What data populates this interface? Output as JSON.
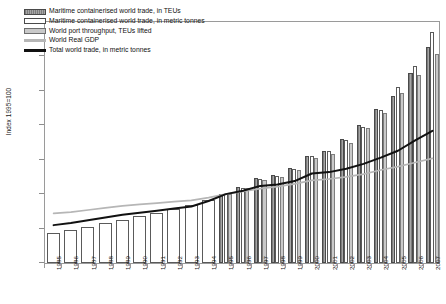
{
  "chart_data": {
    "type": "bar",
    "title": "",
    "subtitle": "",
    "xlabel": "",
    "ylabel": "Index 1995=100",
    "ylim": [
      0,
      350
    ],
    "ytick_values": [
      0,
      50,
      100,
      150,
      200,
      250,
      300,
      350
    ],
    "ytick_labels": [
      "0.0",
      "50.0",
      "100.0",
      "150.0",
      "200.0",
      "250.0",
      "300.0",
      "350.0"
    ],
    "grid": false,
    "legend_position": "upper-left",
    "categories": [
      "1985",
      "1986",
      "1987",
      "1988",
      "1989",
      "1990",
      "1991",
      "1992",
      "1993",
      "1994",
      "1995",
      "1996",
      "1997",
      "1998",
      "1999",
      "2000",
      "2001",
      "2002",
      "2003",
      "2004",
      "2005",
      "2006",
      "2007"
    ],
    "series": [
      {
        "name": "Maritime containerised world trade, in TEUs",
        "kind": "bar",
        "color": "#8f8f8f",
        "values": [
          null,
          null,
          null,
          null,
          null,
          null,
          null,
          null,
          null,
          null,
          100,
          110,
          123,
          128,
          138,
          155,
          163,
          180,
          200,
          223,
          243,
          276,
          313
        ]
      },
      {
        "name": "Maritime containerised world trade, in metric tonnes",
        "kind": "bar",
        "color": "#ffffff",
        "values": [
          44,
          48,
          53,
          58,
          63,
          68,
          73,
          78,
          84,
          92,
          100,
          109,
          122,
          127,
          137,
          155,
          162,
          178,
          198,
          222,
          255,
          286,
          336
        ]
      },
      {
        "name": "World port throughput, TEUs lifted",
        "kind": "bar",
        "color": "#c9c9c9",
        "values": [
          null,
          null,
          null,
          null,
          null,
          null,
          null,
          null,
          null,
          null,
          100,
          109,
          121,
          125,
          135,
          152,
          158,
          175,
          196,
          218,
          247,
          273,
          303
        ]
      },
      {
        "name": "World Real GDP",
        "kind": "line",
        "color": "#b6b6b6",
        "values": [
          72,
          74,
          77,
          80,
          83,
          85,
          87,
          89,
          91,
          95,
          100,
          104,
          108,
          111,
          115,
          120,
          122,
          125,
          129,
          135,
          140,
          146,
          152
        ]
      },
      {
        "name": "Total world trade, in metric tonnes",
        "kind": "line",
        "color": "#111111",
        "values": [
          55,
          58,
          62,
          66,
          70,
          73,
          76,
          79,
          82,
          90,
          100,
          105,
          112,
          114,
          119,
          130,
          132,
          137,
          144,
          153,
          163,
          178,
          192
        ]
      }
    ]
  },
  "legend": {
    "items": [
      {
        "label": "Maritime containerised world trade, in TEUs",
        "swatch": "teu-bar-swatch"
      },
      {
        "label": "Maritime containerised world trade, in metric tonnes",
        "swatch": "tonnes-bar-swatch"
      },
      {
        "label": "World port throughput, TEUs lifted",
        "swatch": "port-bar-swatch"
      },
      {
        "label": "World Real GDP",
        "swatch": "gdp-line-swatch"
      },
      {
        "label": "Total world trade, in metric tonnes",
        "swatch": "trade-line-swatch"
      }
    ]
  }
}
